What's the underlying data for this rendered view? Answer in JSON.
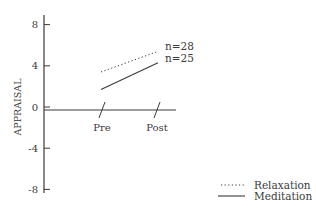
{
  "chart_data": {
    "type": "line",
    "title": "",
    "xlabel": "",
    "ylabel": "APPRAISAL",
    "categories": [
      "Pre",
      "Post"
    ],
    "ylim": [
      -9,
      9
    ],
    "yticks": [
      8,
      4,
      0,
      -4,
      -8
    ],
    "ytick_labels": [
      "8",
      "4",
      "0",
      "-4",
      "-8"
    ],
    "grid": false,
    "legend_position": "lower right",
    "series": [
      {
        "name": "Relaxation",
        "style": "dotted",
        "values": [
          3.4,
          5.4
        ],
        "annotation": "n=28"
      },
      {
        "name": "Meditation",
        "style": "solid",
        "values": [
          1.7,
          4.3
        ],
        "annotation": "n=25"
      }
    ]
  },
  "colors": {
    "ink": "#3a3a3a",
    "background": "#ffffff"
  }
}
